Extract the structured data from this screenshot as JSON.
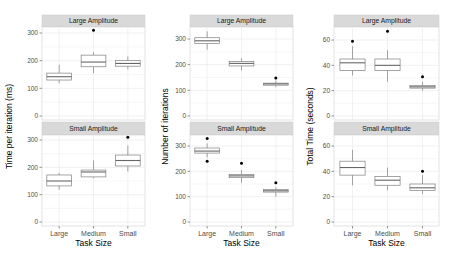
{
  "chart_data": {
    "type": "boxplot",
    "layout": "3 columns x 2 facet rows",
    "facet_rows": [
      "Large Amplitude",
      "Small Amplitude"
    ],
    "categories": [
      "Large",
      "Medium",
      "Small"
    ],
    "xlabel": "Task Size",
    "grid": true,
    "colors": {
      "strip_bg": "#d9d9d9",
      "panel_border": "#d0d0d0",
      "grid": "#ebebeb",
      "box_line": "#7f7f7f",
      "outlier": "#000000"
    },
    "panels": [
      {
        "ylabel": "Time per iteration (ms)",
        "yticks": [
          0,
          100,
          200,
          300
        ],
        "ylim": [
          -10,
          330
        ],
        "facets": [
          {
            "label": "Large Amplitude",
            "boxes": [
              {
                "category": "Large",
                "whisker_low": 118,
                "q1": 130,
                "median": 142,
                "q3": 155,
                "whisker_high": 185,
                "outliers": []
              },
              {
                "category": "Medium",
                "whisker_low": 155,
                "q1": 178,
                "median": 195,
                "q3": 220,
                "whisker_high": 230,
                "outliers": [
                  310
                ]
              },
              {
                "category": "Small",
                "whisker_low": 168,
                "q1": 180,
                "median": 190,
                "q3": 200,
                "whisker_high": 215,
                "outliers": []
              }
            ]
          },
          {
            "label": "Small Amplitude",
            "boxes": [
              {
                "category": "Large",
                "whisker_low": 118,
                "q1": 132,
                "median": 150,
                "q3": 172,
                "whisker_high": 180,
                "outliers": []
              },
              {
                "category": "Medium",
                "whisker_low": 160,
                "q1": 165,
                "median": 183,
                "q3": 190,
                "whisker_high": 225,
                "outliers": []
              },
              {
                "category": "Small",
                "whisker_low": 185,
                "q1": 205,
                "median": 225,
                "q3": 245,
                "whisker_high": 280,
                "outliers": [
                  310
                ]
              }
            ]
          }
        ]
      },
      {
        "ylabel": "Number of iterations",
        "yticks": [
          0,
          100,
          200,
          300
        ],
        "ylim": [
          -10,
          350
        ],
        "facets": [
          {
            "label": "Large Amplitude",
            "boxes": [
              {
                "category": "Large",
                "whisker_low": 258,
                "q1": 282,
                "median": 293,
                "q3": 305,
                "whisker_high": 330,
                "outliers": []
              },
              {
                "category": "Medium",
                "whisker_low": 178,
                "q1": 195,
                "median": 205,
                "q3": 212,
                "whisker_high": 225,
                "outliers": []
              },
              {
                "category": "Small",
                "whisker_low": 112,
                "q1": 120,
                "median": 125,
                "q3": 128,
                "whisker_high": 138,
                "outliers": [
                  148
                ]
              }
            ]
          },
          {
            "label": "Small Amplitude",
            "boxes": [
              {
                "category": "Large",
                "whisker_low": 255,
                "q1": 272,
                "median": 280,
                "q3": 292,
                "whisker_high": 310,
                "outliers": [
                  330,
                  240
                ]
              },
              {
                "category": "Medium",
                "whisker_low": 155,
                "q1": 175,
                "median": 182,
                "q3": 188,
                "whisker_high": 205,
                "outliers": [
                  232
                ]
              },
              {
                "category": "Small",
                "whisker_low": 100,
                "q1": 118,
                "median": 123,
                "q3": 128,
                "whisker_high": 138,
                "outliers": [
                  155
                ]
              }
            ]
          }
        ]
      },
      {
        "ylabel": "Total Time (seconds)",
        "yticks": [
          0,
          20,
          40,
          60
        ],
        "ylim": [
          -2,
          70
        ],
        "facets": [
          {
            "label": "Large Amplitude",
            "boxes": [
              {
                "category": "Large",
                "whisker_low": 32,
                "q1": 36,
                "median": 42,
                "q3": 45,
                "whisker_high": 55,
                "outliers": [
                  59
                ]
              },
              {
                "category": "Medium",
                "whisker_low": 27,
                "q1": 36,
                "median": 40,
                "q3": 45,
                "whisker_high": 52,
                "outliers": [
                  67
                ]
              },
              {
                "category": "Small",
                "whisker_low": 20,
                "q1": 22,
                "median": 23,
                "q3": 24,
                "whisker_high": 27,
                "outliers": [
                  31
                ]
              }
            ]
          },
          {
            "label": "Small Amplitude",
            "boxes": [
              {
                "category": "Large",
                "whisker_low": 29,
                "q1": 37,
                "median": 43,
                "q3": 48,
                "whisker_high": 57,
                "outliers": []
              },
              {
                "category": "Medium",
                "whisker_low": 25,
                "q1": 29,
                "median": 33,
                "q3": 36,
                "whisker_high": 43,
                "outliers": []
              },
              {
                "category": "Small",
                "whisker_low": 22,
                "q1": 25,
                "median": 27,
                "q3": 30,
                "whisker_high": 37,
                "outliers": [
                  40
                ]
              }
            ]
          }
        ]
      }
    ]
  },
  "labels": {
    "xlabel": "Task Size",
    "strip_top": "Large Amplitude",
    "strip_bottom": "Small Amplitude",
    "categories": [
      "Large",
      "Medium",
      "Small"
    ],
    "ylabels": [
      "Time per iteration (ms)",
      "Number of iterations",
      "Total Time (seconds)"
    ]
  }
}
